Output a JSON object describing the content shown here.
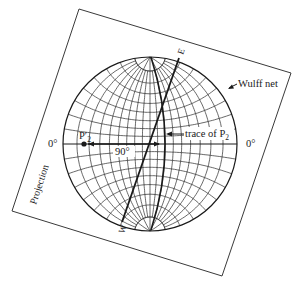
{
  "diagram": {
    "colors": {
      "ink": "#1a1a1a",
      "grid": "#2a2a2a",
      "frame": "#3a3a3a",
      "background": "#ffffff"
    },
    "frame": {
      "corners": [
        [
          79,
          9
        ],
        [
          291,
          73
        ],
        [
          222,
          276
        ],
        [
          12,
          211
        ]
      ],
      "label": "Projection"
    },
    "net": {
      "center": [
        150,
        144
      ],
      "radius": 87,
      "grid_step_deg": 10,
      "label": "Wulff net"
    },
    "labels": {
      "left_zero": "0°",
      "right_zero": "0°",
      "angle": "90°",
      "point": "P",
      "point_prime": "′",
      "point_sub": "2",
      "trace": "trace of P",
      "trace_sub": "2",
      "east": "E",
      "west": "W"
    },
    "great_circle_WE": {
      "from": [
        122,
        222
      ],
      "to": [
        179,
        58
      ]
    },
    "trace_curve": {
      "top": [
        151,
        57
      ],
      "mid": [
        165,
        144
      ],
      "bottom": [
        151,
        230
      ]
    },
    "pole_point": [
      84,
      144
    ],
    "arrow_90": {
      "from": [
        159,
        144
      ],
      "to": [
        88,
        144
      ]
    }
  }
}
